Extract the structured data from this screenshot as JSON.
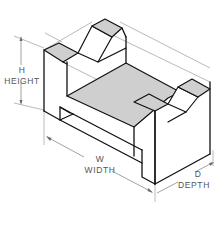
{
  "diagram": {
    "type": "isometric-technical-drawing",
    "colors": {
      "edge": "#111111",
      "shaded_face": "#cfcfcf",
      "dimension_line": "#7a7a7a",
      "label_text": "#555555",
      "background": "#ffffff"
    },
    "dimensions": [
      {
        "abbr": "H",
        "label": "HEIGHT"
      },
      {
        "abbr": "W",
        "label": "WIDTH"
      },
      {
        "abbr": "D",
        "label": "DEPTH"
      }
    ]
  }
}
